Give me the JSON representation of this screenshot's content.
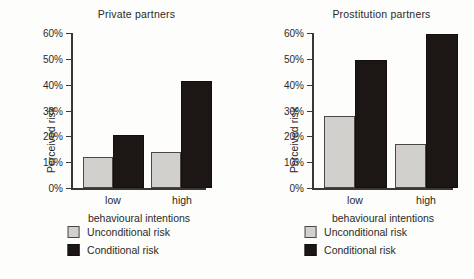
{
  "chart_data": [
    {
      "type": "bar",
      "title": "Private partners",
      "xlabel": "behavioural intentions",
      "ylabel": "Perceived risk",
      "categories": [
        "low",
        "high"
      ],
      "ylim": [
        0,
        60
      ],
      "ytick_labels": [
        "0%",
        "10%",
        "20%",
        "30%",
        "40%",
        "50%",
        "60%"
      ],
      "ytick_values": [
        0,
        10,
        20,
        30,
        40,
        50,
        60
      ],
      "grid": false,
      "legend_position": "bottom",
      "series": [
        {
          "name": "Unconditional risk",
          "color": "#d2d0cd",
          "values": [
            12,
            14
          ]
        },
        {
          "name": "Conditional risk",
          "color": "#1c1714",
          "values": [
            20.5,
            41.5
          ]
        }
      ]
    },
    {
      "type": "bar",
      "title": "Prostitution partners",
      "xlabel": "behavioural intentions",
      "ylabel": "Perceived risk",
      "categories": [
        "low",
        "high"
      ],
      "ylim": [
        0,
        60
      ],
      "ytick_labels": [
        "0%",
        "10%",
        "20%",
        "30%",
        "40%",
        "50%",
        "60%"
      ],
      "ytick_values": [
        0,
        10,
        20,
        30,
        40,
        50,
        60
      ],
      "grid": false,
      "legend_position": "bottom",
      "series": [
        {
          "name": "Unconditional risk",
          "color": "#d2d0cd",
          "values": [
            28,
            17
          ]
        },
        {
          "name": "Conditional risk",
          "color": "#1c1714",
          "values": [
            49.5,
            59.5
          ]
        }
      ]
    }
  ]
}
